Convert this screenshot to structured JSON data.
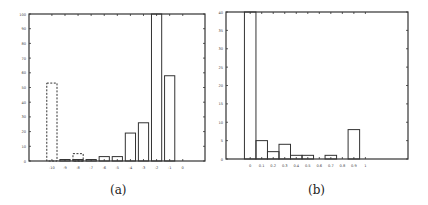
{
  "chart_data": [
    {
      "type": "bar",
      "panel_label": "(a)",
      "title": "",
      "xlabel": "",
      "ylabel": "",
      "ylim": [
        0,
        100
      ],
      "xlim": [
        -11.75,
        1.7
      ],
      "yticks": [
        0,
        10,
        20,
        30,
        40,
        50,
        60,
        70,
        80,
        90,
        100
      ],
      "xticks": [
        -10,
        -9,
        -8,
        -7,
        -6,
        -5,
        -4,
        -3,
        -2,
        -1,
        0
      ],
      "grid": false,
      "legend": null,
      "series": [
        {
          "name": "solid",
          "style": "solid",
          "categories": [
            -9,
            -8,
            -7,
            -6,
            -5,
            -4,
            -3,
            -2,
            -1
          ],
          "values": [
            1,
            1,
            1,
            3,
            3,
            19,
            26,
            100,
            58
          ],
          "clipped": [
            false,
            false,
            false,
            false,
            false,
            false,
            false,
            true,
            false
          ]
        },
        {
          "name": "dashed",
          "style": "dashed",
          "categories": [
            -10,
            -8
          ],
          "values": [
            53,
            5
          ]
        }
      ]
    },
    {
      "type": "bar",
      "panel_label": "(b)",
      "title": "",
      "xlabel": "",
      "ylabel": "",
      "ylim": [
        0,
        40
      ],
      "xlim": [
        -0.21,
        1.37
      ],
      "yticks": [
        0,
        5,
        10,
        15,
        20,
        25,
        30,
        35,
        40
      ],
      "xticks": [
        0,
        0.1,
        0.2,
        0.3,
        0.4,
        0.5,
        0.6,
        0.7,
        0.8,
        0.9,
        1
      ],
      "grid": false,
      "legend": null,
      "series": [
        {
          "name": "solid",
          "style": "solid",
          "categories": [
            0,
            0.1,
            0.2,
            0.3,
            0.4,
            0.5,
            0.6,
            0.7,
            0.8,
            0.9
          ],
          "values": [
            40,
            5,
            2,
            4,
            1,
            1,
            0,
            1,
            0,
            8
          ],
          "clipped": [
            true,
            false,
            false,
            false,
            false,
            false,
            false,
            false,
            false,
            false
          ]
        }
      ]
    }
  ],
  "captions": {
    "a": "(a)",
    "b": "(b)"
  },
  "colors": {
    "axis": "#333333",
    "bar_edge": "#333333",
    "background": "#ffffff"
  }
}
